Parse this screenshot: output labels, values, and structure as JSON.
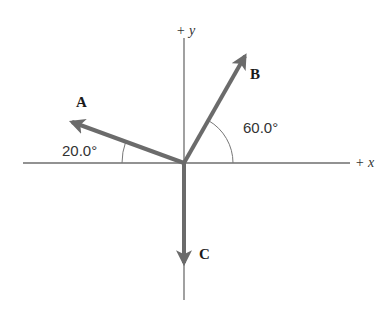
{
  "diagram": {
    "colors": {
      "axis": "#6e6e6e",
      "vector": "#6b6b6b",
      "arc": "#777777",
      "text": "#1a1a1a"
    },
    "origin": {
      "x": 184,
      "y": 163
    },
    "axes": {
      "x_label": "+ x",
      "y_label": "+ y"
    },
    "vectors": [
      {
        "name": "A",
        "label": "A",
        "tip": {
          "x": 67,
          "y": 120
        },
        "angle_label": "20.0°",
        "angle_deg": 20.0,
        "reference": "-x axis"
      },
      {
        "name": "B",
        "label": "B",
        "tip": {
          "x": 248,
          "y": 51
        },
        "angle_label": "60.0°",
        "angle_deg": 60.0,
        "reference": "+x axis"
      },
      {
        "name": "C",
        "label": "C",
        "tip": {
          "x": 184,
          "y": 268
        },
        "angle_label": "",
        "angle_deg": 270,
        "reference": "-y axis"
      }
    ]
  }
}
